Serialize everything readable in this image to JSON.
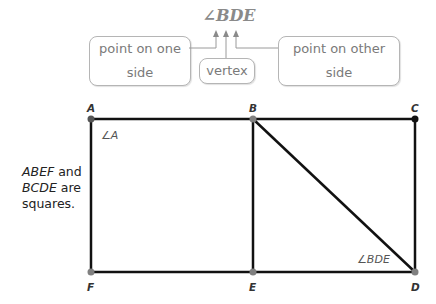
{
  "notation": {
    "text": "∠BDE"
  },
  "callouts": {
    "left": "point on one side",
    "middle": "vertex",
    "right": "point on other side"
  },
  "note": {
    "line1_italic": "ABEF",
    "line1_rest": " and",
    "line2_italic": "BCDE",
    "line2_rest": " are",
    "line3": "squares."
  },
  "figure": {
    "points": {
      "A": {
        "label": "A",
        "x": 91,
        "y": 119
      },
      "B": {
        "label": "B",
        "x": 253,
        "y": 119
      },
      "C": {
        "label": "C",
        "x": 415,
        "y": 119
      },
      "D": {
        "label": "D",
        "x": 415,
        "y": 272
      },
      "E": {
        "label": "E",
        "x": 253,
        "y": 272
      },
      "F": {
        "label": "F",
        "x": 91,
        "y": 272
      }
    },
    "angle_labels": {
      "A": "∠A",
      "BDE": "∠BDE"
    },
    "colors": {
      "line": "#111111",
      "point_gray": "#808080",
      "point_black": "#111111",
      "connector": "#9a9a9a"
    }
  }
}
